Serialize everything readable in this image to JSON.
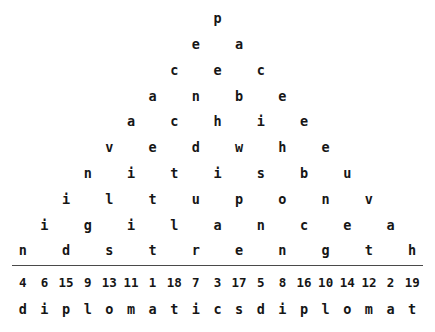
{
  "puzzle": {
    "type": "letter-pyramid",
    "columns": 19,
    "pyramid_rows": [
      {
        "index": 1,
        "letters": [
          "p"
        ]
      },
      {
        "index": 2,
        "letters": [
          "e",
          "a"
        ]
      },
      {
        "index": 3,
        "letters": [
          "c",
          "e",
          "c"
        ]
      },
      {
        "index": 4,
        "letters": [
          "a",
          "n",
          "b",
          "e"
        ]
      },
      {
        "index": 5,
        "letters": [
          "a",
          "c",
          "h",
          "i",
          "e"
        ]
      },
      {
        "index": 6,
        "letters": [
          "v",
          "e",
          "d",
          "w",
          "h",
          "e"
        ]
      },
      {
        "index": 7,
        "letters": [
          "n",
          "i",
          "t",
          "i",
          "s",
          "b",
          "u"
        ]
      },
      {
        "index": 8,
        "letters": [
          "i",
          "l",
          "t",
          "u",
          "p",
          "o",
          "n",
          "v"
        ]
      },
      {
        "index": 9,
        "letters": [
          "i",
          "g",
          "i",
          "l",
          "a",
          "n",
          "c",
          "e",
          "a"
        ]
      },
      {
        "index": 10,
        "letters": [
          "n",
          "d",
          "s",
          "t",
          "r",
          "e",
          "n",
          "g",
          "t",
          "h"
        ]
      }
    ],
    "pyramid_row_words": [
      "p",
      "ea",
      "cec",
      "anbe",
      "achie",
      "vedwhe",
      "nitisbu",
      "iltuponv",
      "igilancea",
      "ndstrength"
    ],
    "numbers": [
      4,
      6,
      15,
      9,
      13,
      11,
      1,
      18,
      7,
      3,
      17,
      5,
      8,
      16,
      10,
      14,
      12,
      2,
      19
    ],
    "answer_letters": [
      "d",
      "i",
      "p",
      "l",
      "o",
      "m",
      "a",
      "t",
      "i",
      "c",
      "s",
      "d",
      "i",
      "p",
      "l",
      "o",
      "m",
      "a",
      "t"
    ],
    "answer_text": "diplomaticsdiplomat"
  },
  "colors": {
    "text": "#161616",
    "rule": "#4a4a4a",
    "background": "#ffffff"
  }
}
